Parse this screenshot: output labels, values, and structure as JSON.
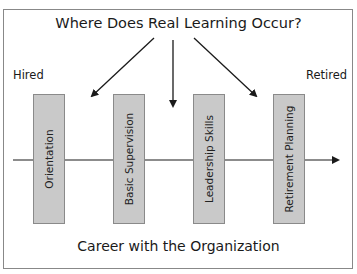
{
  "diagram": {
    "title": "Where Does Real Learning Occur?",
    "start_label": "Hired",
    "end_label": "Retired",
    "footer": "Career with the Organization",
    "stages": [
      {
        "label": "Orientation"
      },
      {
        "label": "Basic Supervision"
      },
      {
        "label": "Leadership Skills"
      },
      {
        "label": "Retirement Planning"
      }
    ],
    "colors": {
      "bar_fill": "#c9c9c9",
      "bar_border": "#8a8a8a",
      "line": "#1a1a1a",
      "frame": "#888888"
    }
  }
}
